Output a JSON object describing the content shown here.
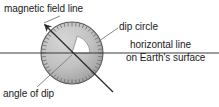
{
  "figure": {
    "labels": {
      "magnetic_field_line": "magnetic field line",
      "dip_circle": "dip circle",
      "horizontal_line": "horizontal line",
      "earth_surface": "on Earth's surface",
      "angle_of_dip": "angle of dip"
    },
    "colors": {
      "background": "#ffffff",
      "text": "#1a1a1a",
      "line": "#3a3a3a",
      "circle_fill_light": "#c9c9c9",
      "circle_fill_dark": "#9a9a9a",
      "circle_stroke": "#555555",
      "tick": "#6b6b6b",
      "wedge_fill": "#ffffff"
    },
    "geometry": {
      "circle_center_x": 72,
      "circle_center_y": 53,
      "circle_radius": 31,
      "tick_count": 48,
      "horizontal_line_y": 53,
      "horizontal_line_x1": 0,
      "horizontal_line_x2": 219,
      "field_line_x1": 41,
      "field_line_y1": 21,
      "field_line_x2": 113,
      "field_line_y2": 92,
      "angle_of_dip_degrees": 45
    }
  }
}
